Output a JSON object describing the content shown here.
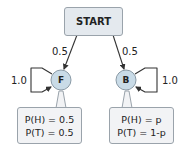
{
  "diagram": {
    "start": {
      "label": "START"
    },
    "nodes": [
      {
        "id": "F",
        "label": "F",
        "self_loop": "1.0",
        "emission": {
          "line1": "P(H) = 0.5",
          "line2": "P(T) = 0.5"
        }
      },
      {
        "id": "B",
        "label": "B",
        "self_loop": "1.0",
        "emission": {
          "line1": "P(H) = p",
          "line2": "P(T) = 1-p"
        }
      }
    ],
    "edges": [
      {
        "from": "START",
        "to": "F",
        "label": "0.5"
      },
      {
        "from": "START",
        "to": "B",
        "label": "0.5"
      },
      {
        "from": "F",
        "to": "F",
        "label": "1.0"
      },
      {
        "from": "B",
        "to": "B",
        "label": "1.0"
      }
    ],
    "colors": {
      "start_fill": "#e4e9ee",
      "node_fill": "#c9dbe7",
      "callout_fill": "#f2f3f5",
      "border": "#9aa3ab",
      "edge": "#333333"
    }
  }
}
